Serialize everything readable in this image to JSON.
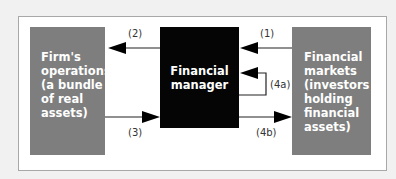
{
  "diagram": {
    "nodes": {
      "firm_operations": {
        "lines": [
          "Firm's",
          "operations",
          "(a bundle",
          "of real",
          "assets)"
        ],
        "color": "#7e7e7e"
      },
      "financial_manager": {
        "lines": [
          "Financial",
          "manager"
        ],
        "color": "#050505"
      },
      "financial_markets": {
        "lines": [
          "Financial",
          "markets",
          "(investors",
          "holding",
          "financial",
          "assets)"
        ],
        "color": "#7e7e7e"
      }
    },
    "arrows": {
      "a1": {
        "label": "(1)",
        "from": "financial_markets",
        "to": "financial_manager"
      },
      "a2": {
        "label": "(2)",
        "from": "financial_manager",
        "to": "firm_operations"
      },
      "a3": {
        "label": "(3)",
        "from": "firm_operations",
        "to": "financial_manager"
      },
      "a4a": {
        "label": "(4a)",
        "from": "financial_manager",
        "to": "financial_manager"
      },
      "a4b": {
        "label": "(4b)",
        "from": "financial_manager",
        "to": "financial_markets"
      }
    }
  }
}
